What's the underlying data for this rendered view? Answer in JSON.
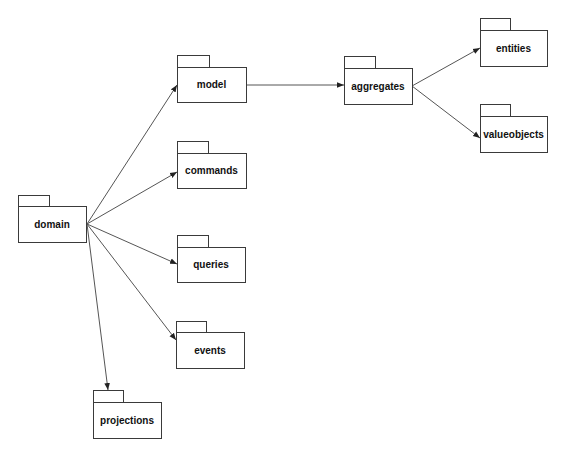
{
  "diagram": {
    "type": "UML package dependency diagram",
    "stroke_color": "#3a3a3a",
    "arrow_color": "#555555",
    "background": "#ffffff",
    "packages": [
      {
        "id": "domain",
        "label": "domain",
        "tab": [
          18,
          195,
          31,
          11
        ],
        "body": [
          18,
          206,
          68,
          36
        ]
      },
      {
        "id": "model",
        "label": "model",
        "tab": [
          177,
          55,
          32,
          12
        ],
        "body": [
          177,
          67,
          69,
          35
        ]
      },
      {
        "id": "commands",
        "label": "commands",
        "tab": [
          177,
          141,
          31,
          12
        ],
        "body": [
          177,
          153,
          69,
          35
        ]
      },
      {
        "id": "queries",
        "label": "queries",
        "tab": [
          177,
          235,
          31,
          12
        ],
        "body": [
          177,
          247,
          68,
          35
        ]
      },
      {
        "id": "events",
        "label": "events",
        "tab": [
          176,
          321,
          30,
          11
        ],
        "body": [
          176,
          332,
          68,
          36
        ]
      },
      {
        "id": "projections",
        "label": "projections",
        "tab": [
          93,
          390,
          30,
          12
        ],
        "body": [
          93,
          402,
          68,
          36
        ]
      },
      {
        "id": "aggregates",
        "label": "aggregates",
        "tab": [
          344,
          56,
          31,
          12
        ],
        "body": [
          344,
          68,
          68,
          36
        ]
      },
      {
        "id": "entities",
        "label": "entities",
        "tab": [
          480,
          18,
          30,
          12
        ],
        "body": [
          480,
          30,
          67,
          36
        ]
      },
      {
        "id": "valueobjects",
        "label": "valueobjects",
        "tab": [
          480,
          104,
          30,
          12
        ],
        "body": [
          480,
          116,
          67,
          36
        ]
      }
    ],
    "dependencies": [
      {
        "from": "domain",
        "to": "model",
        "points": [
          87,
          224,
          177,
          85
        ]
      },
      {
        "from": "domain",
        "to": "commands",
        "points": [
          87,
          224,
          177,
          172
        ]
      },
      {
        "from": "domain",
        "to": "queries",
        "points": [
          87,
          224,
          177,
          264
        ]
      },
      {
        "from": "domain",
        "to": "events",
        "points": [
          87,
          224,
          176,
          340
        ]
      },
      {
        "from": "domain",
        "to": "projections",
        "points": [
          87,
          224,
          108,
          390
        ]
      },
      {
        "from": "model",
        "to": "aggregates",
        "points": [
          246,
          85,
          344,
          85
        ]
      },
      {
        "from": "aggregates",
        "to": "entities",
        "points": [
          412,
          86,
          480,
          48
        ]
      },
      {
        "from": "aggregates",
        "to": "valueobjects",
        "points": [
          412,
          86,
          480,
          138
        ]
      }
    ]
  }
}
